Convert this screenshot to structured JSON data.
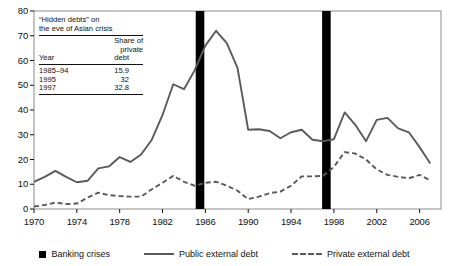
{
  "chart_data": {
    "type": "line",
    "title": "",
    "xlabel": "",
    "ylabel": "",
    "xlim": [
      1970,
      2008
    ],
    "ylim": [
      0,
      80
    ],
    "grid": false,
    "legend_position": "bottom",
    "y_ticks": [
      0,
      10,
      20,
      30,
      40,
      50,
      60,
      70,
      80
    ],
    "x_ticks": [
      1970,
      1974,
      1978,
      1982,
      1986,
      1990,
      1994,
      1998,
      2002,
      2006
    ],
    "series": [
      {
        "name": "Public external debt",
        "style": "solid",
        "color": "#5a5a5a",
        "x": [
          1970,
          1971,
          1972,
          1973,
          1974,
          1975,
          1976,
          1977,
          1978,
          1979,
          1980,
          1981,
          1982,
          1983,
          1984,
          1985,
          1986,
          1987,
          1988,
          1989,
          1990,
          1991,
          1992,
          1993,
          1994,
          1995,
          1996,
          1997,
          1998,
          1999,
          2000,
          2001,
          2002,
          2003,
          2004,
          2005,
          2006,
          2007
        ],
        "values": [
          11,
          13,
          15.4,
          13,
          10.8,
          11.4,
          16.4,
          17.2,
          21,
          19,
          22,
          28,
          38,
          50.4,
          48.4,
          56,
          66,
          72,
          67,
          57,
          32,
          32.2,
          31.5,
          28.6,
          31,
          32,
          28,
          27.4,
          28.2,
          39,
          34,
          27.4,
          36,
          36.8,
          32.6,
          31,
          25,
          18.4
        ]
      },
      {
        "name": "Private external debt",
        "style": "dashed",
        "color": "#5a5a5a",
        "x": [
          1970,
          1971,
          1972,
          1973,
          1974,
          1975,
          1976,
          1977,
          1978,
          1979,
          1980,
          1981,
          1982,
          1983,
          1984,
          1985,
          1986,
          1987,
          1988,
          1989,
          1990,
          1991,
          1992,
          1993,
          1994,
          1995,
          1996,
          1997,
          1998,
          1999,
          2000,
          2001,
          2002,
          2003,
          2004,
          2005,
          2006,
          2007
        ],
        "values": [
          1,
          1.6,
          2.6,
          2,
          2.2,
          4.6,
          6.6,
          5.6,
          5.2,
          5,
          5,
          8,
          10.6,
          13.4,
          11,
          9.4,
          10.6,
          11,
          9.4,
          7.4,
          4,
          5,
          6.4,
          7,
          9.4,
          13.2,
          13.2,
          13.4,
          17,
          23,
          22.4,
          20,
          16,
          13.8,
          13,
          12.4,
          13.8,
          11.6
        ]
      }
    ],
    "crisis_bands": [
      {
        "name": "Banking crises",
        "start": 1985.1,
        "end": 1985.9,
        "color": "#000000"
      },
      {
        "name": "Banking crises",
        "start": 1996.9,
        "end": 1997.7,
        "color": "#000000"
      }
    ]
  },
  "y_axis": {
    "ticks": [
      "0",
      "10",
      "20",
      "30",
      "40",
      "50",
      "60",
      "70",
      "80"
    ]
  },
  "x_axis": {
    "ticks": [
      "1970",
      "1974",
      "1978",
      "1982",
      "1986",
      "1990",
      "1994",
      "1998",
      "2002",
      "2006"
    ]
  },
  "inset_table": {
    "title_line1": "“Hidden debts” on",
    "title_line2": "the eve of Asian crisis",
    "col_header_line1": "Share of",
    "col_header_line2": "private",
    "year_label": "Year",
    "debt_label": "debt",
    "rows": [
      {
        "year": "1985–94",
        "share": "15.9"
      },
      {
        "year": "1995",
        "share": "32"
      },
      {
        "year": "1997",
        "share": "32.8"
      }
    ]
  },
  "legend": {
    "items": [
      {
        "label": "Banking crises",
        "marker": "square-swatch"
      },
      {
        "label": "Public external debt",
        "marker": "solid-line-swatch"
      },
      {
        "label": "Private external debt",
        "marker": "dashed-line-swatch"
      }
    ]
  },
  "colors": {
    "line": "#5a5a5a",
    "crisis": "#000000",
    "frame": "#8c8c8c",
    "text": "#111111"
  }
}
